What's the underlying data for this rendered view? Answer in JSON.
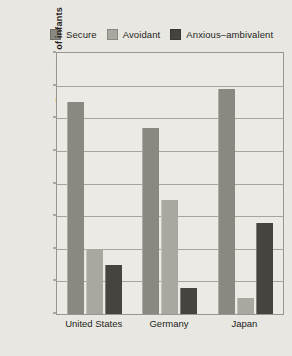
{
  "chart_data": {
    "type": "bar",
    "title": "",
    "subtitle": "",
    "xlabel": "",
    "ylabel": "Percentage of infants",
    "categories": [
      "United States",
      "Germany",
      "Japan"
    ],
    "series": [
      {
        "name": "Secure",
        "color": "#8a8880",
        "values": [
          65,
          57,
          69
        ]
      },
      {
        "name": "Avoidant",
        "color": "#a9a7a0",
        "values": [
          20,
          35,
          5
        ]
      },
      {
        "name": "Anxious–ambivalent",
        "color": "#46443f",
        "values": [
          15,
          8,
          28
        ]
      }
    ],
    "ylim": [
      0,
      80
    ],
    "ytick_step": 10,
    "yticks": [
      "0",
      "10",
      "20",
      "30",
      "40",
      "50",
      "60",
      "70",
      "80"
    ],
    "grid": true,
    "legend_position": "top"
  },
  "legend": {
    "entries": [
      {
        "label": "Secure"
      },
      {
        "label": "Avoidant"
      },
      {
        "label": "Anxious–ambivalent"
      }
    ]
  },
  "colors": {
    "page_background": "#e9e7e2",
    "plot_background": "#eceae5",
    "axis_line": "#9a968f",
    "gridline": "#a8a49d",
    "text": "#231f20",
    "series_secure": "#8a8880",
    "series_avoidant": "#a9a7a0",
    "series_anxious": "#46443f"
  }
}
